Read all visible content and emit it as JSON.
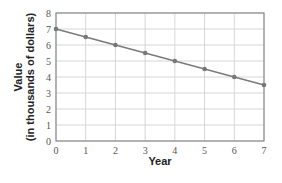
{
  "chart_data": {
    "type": "line",
    "title": "",
    "xlabel": "Year",
    "ylabel_line1": "Value",
    "ylabel_line2": "(in thousands of dollars)",
    "x": [
      0,
      1,
      2,
      3,
      4,
      5,
      6,
      7
    ],
    "series": [
      {
        "name": "Value",
        "values": [
          7,
          6.5,
          6,
          5.5,
          5,
          4.5,
          4,
          3.5
        ]
      }
    ],
    "xlim": [
      0,
      7
    ],
    "ylim": [
      0,
      8
    ],
    "xticks": [
      0,
      1,
      2,
      3,
      4,
      5,
      6,
      7
    ],
    "yticks": [
      0,
      1,
      2,
      3,
      4,
      5,
      6,
      7,
      8
    ],
    "grid": true,
    "legend": "none"
  },
  "colors": {
    "line": "#7a7a7a",
    "marker": "#777777",
    "grid": "#d6d6d6",
    "frame": "#8c8c8c"
  }
}
